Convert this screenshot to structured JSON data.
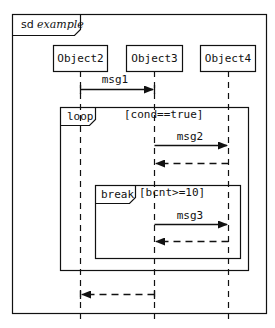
{
  "diagram": {
    "type": "sequence",
    "frame": {
      "keyword": "sd",
      "name": "example"
    },
    "objects": [
      {
        "id": "o2",
        "label": "Object2"
      },
      {
        "id": "o3",
        "label": "Object3"
      },
      {
        "id": "o4",
        "label": "Object4"
      }
    ],
    "messages": [
      {
        "id": "m1",
        "label": "msg1",
        "from": "Object2",
        "to": "Object3",
        "kind": "sync"
      },
      {
        "id": "m2",
        "label": "msg2",
        "from": "Object3",
        "to": "Object4",
        "kind": "sync"
      },
      {
        "id": "r2",
        "label": "",
        "from": "Object4",
        "to": "Object3",
        "kind": "return"
      },
      {
        "id": "m3",
        "label": "msg3",
        "from": "Object3",
        "to": "Object4",
        "kind": "sync"
      },
      {
        "id": "r3",
        "label": "",
        "from": "Object4",
        "to": "Object3",
        "kind": "return"
      },
      {
        "id": "r1",
        "label": "",
        "from": "Object3",
        "to": "Object2",
        "kind": "return"
      }
    ],
    "fragments": [
      {
        "operator": "loop",
        "guard": "[cond==true]"
      },
      {
        "operator": "break",
        "guard": "[bcnt>=10]"
      }
    ]
  }
}
